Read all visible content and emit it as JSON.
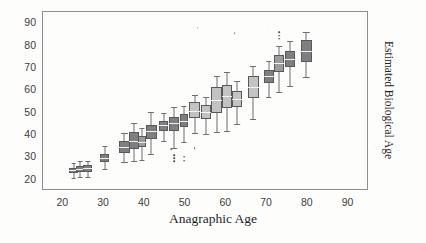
{
  "chart_data": {
    "type": "box",
    "title": "",
    "xlabel": "Anagraphic Age",
    "ylabel": "Estimated Biological Age",
    "xlim": [
      15,
      95
    ],
    "ylim": [
      15,
      95
    ],
    "xticks": [
      20,
      30,
      40,
      50,
      60,
      70,
      80,
      90
    ],
    "yticks": [
      20,
      30,
      40,
      50,
      60,
      70,
      80,
      90
    ],
    "grid": false,
    "legend": null,
    "boxes": [
      {
        "x": 22.5,
        "q1": 23.0,
        "median": 24.2,
        "q3": 25.4,
        "low": 21.0,
        "high": 27.6,
        "shade": "dark",
        "width": 2.0,
        "outliers": []
      },
      {
        "x": 24.2,
        "q1": 23.4,
        "median": 24.8,
        "q3": 26.2,
        "low": 21.4,
        "high": 28.2,
        "shade": "dark",
        "width": 2.0,
        "outliers": []
      },
      {
        "x": 26.0,
        "q1": 23.6,
        "median": 25.1,
        "q3": 26.6,
        "low": 21.2,
        "high": 28.6,
        "shade": "dark",
        "width": 2.2,
        "outliers": []
      },
      {
        "x": 30.2,
        "q1": 27.8,
        "median": 29.8,
        "q3": 31.4,
        "low": 25.0,
        "high": 35.0,
        "shade": "dark",
        "width": 2.2,
        "outliers": []
      },
      {
        "x": 35.0,
        "q1": 32.0,
        "median": 34.6,
        "q3": 37.4,
        "low": 28.0,
        "high": 41.0,
        "shade": "dark",
        "width": 2.6,
        "outliers": []
      },
      {
        "x": 37.4,
        "q1": 33.6,
        "median": 37.4,
        "q3": 41.4,
        "low": 28.6,
        "high": 45.6,
        "shade": "dark",
        "width": 2.4,
        "outliers": []
      },
      {
        "x": 39.3,
        "q1": 34.6,
        "median": 36.8,
        "q3": 39.8,
        "low": 29.0,
        "high": 43.0,
        "shade": "mid",
        "width": 2.2,
        "outliers": []
      },
      {
        "x": 41.6,
        "q1": 38.2,
        "median": 41.6,
        "q3": 44.6,
        "low": 31.6,
        "high": 50.2,
        "shade": "dark",
        "width": 2.6,
        "outliers": []
      },
      {
        "x": 44.6,
        "q1": 41.8,
        "median": 44.4,
        "q3": 46.4,
        "low": 37.4,
        "high": 50.0,
        "shade": "dark",
        "width": 2.4,
        "outliers": []
      },
      {
        "x": 47.2,
        "q1": 42.0,
        "median": 45.6,
        "q3": 48.0,
        "low": 34.0,
        "high": 52.4,
        "shade": "dark",
        "width": 2.4,
        "outliers": [
          31.0,
          29.6,
          28.2
        ]
      },
      {
        "x": 49.6,
        "q1": 43.4,
        "median": 46.2,
        "q3": 49.2,
        "low": 37.0,
        "high": 53.2,
        "shade": "dark",
        "width": 2.2,
        "outliers": [
          30.4,
          28.6
        ]
      },
      {
        "x": 52.2,
        "q1": 47.6,
        "median": 50.6,
        "q3": 54.8,
        "low": 41.0,
        "high": 58.0,
        "shade": "light",
        "width": 2.6,
        "outliers": [
          34.2
        ]
      },
      {
        "x": 55.0,
        "q1": 47.0,
        "median": 50.2,
        "q3": 53.6,
        "low": 40.6,
        "high": 57.2,
        "shade": "light",
        "width": 2.4,
        "outliers": []
      },
      {
        "x": 57.6,
        "q1": 50.0,
        "median": 55.6,
        "q3": 61.4,
        "low": 41.4,
        "high": 66.6,
        "shade": "light",
        "width": 2.6,
        "outliers": []
      },
      {
        "x": 60.2,
        "q1": 52.0,
        "median": 57.4,
        "q3": 62.4,
        "low": 42.0,
        "high": 68.4,
        "shade": "light",
        "width": 2.6,
        "outliers": []
      },
      {
        "x": 62.6,
        "q1": 52.6,
        "median": 56.2,
        "q3": 59.6,
        "low": 45.0,
        "high": 64.2,
        "shade": "light",
        "width": 2.4,
        "outliers": []
      },
      {
        "x": 66.6,
        "q1": 56.4,
        "median": 61.6,
        "q3": 66.2,
        "low": 47.0,
        "high": 71.0,
        "shade": "light",
        "width": 2.6,
        "outliers": []
      },
      {
        "x": 70.4,
        "q1": 63.4,
        "median": 66.2,
        "q3": 69.0,
        "low": 57.0,
        "high": 73.0,
        "shade": "dark",
        "width": 2.4,
        "outliers": []
      },
      {
        "x": 73.0,
        "q1": 68.0,
        "median": 72.0,
        "q3": 75.6,
        "low": 59.4,
        "high": 80.0,
        "shade": "mid",
        "width": 2.4,
        "outliers": [
          83.0,
          84.4,
          86.0
        ]
      },
      {
        "x": 75.6,
        "q1": 70.4,
        "median": 74.0,
        "q3": 77.6,
        "low": 62.0,
        "high": 82.0,
        "shade": "dark",
        "width": 2.4,
        "outliers": []
      },
      {
        "x": 79.6,
        "q1": 72.6,
        "median": 77.4,
        "q3": 82.4,
        "low": 66.0,
        "high": 86.0,
        "shade": "dark",
        "width": 2.8,
        "outliers": []
      }
    ],
    "stray_marks": [
      {
        "x": 53.0,
        "y": 88.0
      },
      {
        "x": 62.0,
        "y": 85.5
      },
      {
        "x": 46.4,
        "y": 33.6
      }
    ]
  },
  "colors": {
    "frame": "#8d8d8d",
    "box_dark": "#7f7f82",
    "box_mid": "#9b9b9e",
    "box_light": "#c3c3c4",
    "box_edge": "#58585a",
    "whisker": "#6e6e6e",
    "median": "#ffffff",
    "text": "#1f1f1f",
    "tick_text": "#3c3c3c",
    "background": "#fdfdfc"
  }
}
